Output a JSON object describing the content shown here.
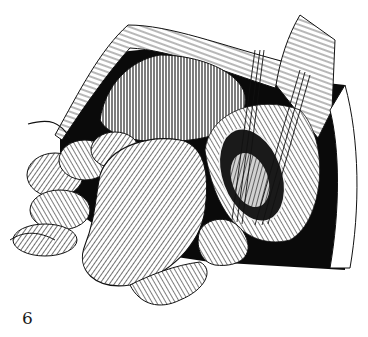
{
  "figure": {
    "label": "6",
    "colors": {
      "ink": "#111111",
      "paper": "#ffffff",
      "shadow": "#000000"
    }
  }
}
